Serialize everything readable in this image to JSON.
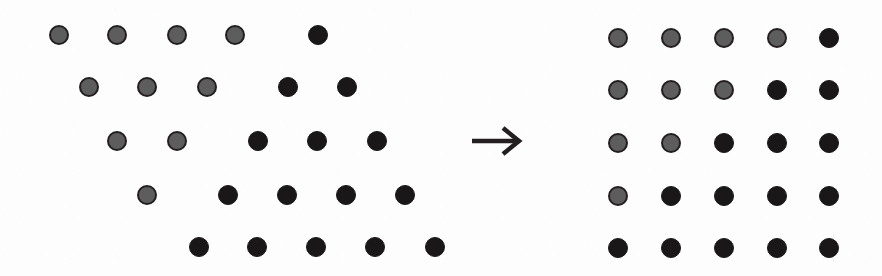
{
  "figure": {
    "background_color": "#fdfdfd",
    "dot_colors": {
      "gray_fill": "#5d5d5d",
      "gray_outline": "#231f20",
      "black_fill": "#1a1718"
    },
    "dot_diameter": 20,
    "arrow": {
      "icon": "right-arrow-icon",
      "label": "→",
      "color": "#231f20",
      "x": 473,
      "y": 141,
      "length": 48
    }
  },
  "chart_data": {
    "type": "scatter",
    "title": "",
    "subtitle": "",
    "xlabel": "",
    "ylabel": "",
    "grid": false,
    "legend": [],
    "annotations": [
      {
        "name": "transform-arrow",
        "text": "→",
        "x": 497,
        "y": 141
      }
    ],
    "panels": [
      {
        "name": "source-staggered-grid",
        "label": "staggered triangular arrangement",
        "rows": 5,
        "cols": 5,
        "row_y": [
          35,
          87,
          141,
          195,
          247
        ],
        "row_x_start": [
          59,
          89,
          117,
          147,
          199
        ],
        "col_spacing": 59,
        "gray_counts_per_row": [
          4,
          3,
          2,
          1,
          0
        ],
        "black_counts_per_row": [
          1,
          2,
          3,
          4,
          5
        ],
        "points": [
          {
            "row": 1,
            "col": 1,
            "x": 59,
            "y": 35,
            "state": "gray"
          },
          {
            "row": 1,
            "col": 2,
            "x": 117,
            "y": 35,
            "state": "gray"
          },
          {
            "row": 1,
            "col": 3,
            "x": 177,
            "y": 35,
            "state": "gray"
          },
          {
            "row": 1,
            "col": 4,
            "x": 235,
            "y": 35,
            "state": "gray"
          },
          {
            "row": 1,
            "col": 5,
            "x": 318,
            "y": 35,
            "state": "black"
          },
          {
            "row": 2,
            "col": 1,
            "x": 89,
            "y": 87,
            "state": "gray"
          },
          {
            "row": 2,
            "col": 2,
            "x": 147,
            "y": 87,
            "state": "gray"
          },
          {
            "row": 2,
            "col": 3,
            "x": 207,
            "y": 87,
            "state": "gray"
          },
          {
            "row": 2,
            "col": 4,
            "x": 288,
            "y": 87,
            "state": "black"
          },
          {
            "row": 2,
            "col": 5,
            "x": 347,
            "y": 87,
            "state": "black"
          },
          {
            "row": 3,
            "col": 1,
            "x": 117,
            "y": 141,
            "state": "gray"
          },
          {
            "row": 3,
            "col": 2,
            "x": 177,
            "y": 141,
            "state": "gray"
          },
          {
            "row": 3,
            "col": 3,
            "x": 258,
            "y": 141,
            "state": "black"
          },
          {
            "row": 3,
            "col": 4,
            "x": 317,
            "y": 141,
            "state": "black"
          },
          {
            "row": 3,
            "col": 5,
            "x": 377,
            "y": 141,
            "state": "black"
          },
          {
            "row": 4,
            "col": 1,
            "x": 147,
            "y": 195,
            "state": "gray"
          },
          {
            "row": 4,
            "col": 2,
            "x": 228,
            "y": 195,
            "state": "black"
          },
          {
            "row": 4,
            "col": 3,
            "x": 287,
            "y": 195,
            "state": "black"
          },
          {
            "row": 4,
            "col": 4,
            "x": 346,
            "y": 195,
            "state": "black"
          },
          {
            "row": 4,
            "col": 5,
            "x": 405,
            "y": 195,
            "state": "black"
          },
          {
            "row": 5,
            "col": 1,
            "x": 199,
            "y": 247,
            "state": "black"
          },
          {
            "row": 5,
            "col": 2,
            "x": 257,
            "y": 247,
            "state": "black"
          },
          {
            "row": 5,
            "col": 3,
            "x": 316,
            "y": 247,
            "state": "black"
          },
          {
            "row": 5,
            "col": 4,
            "x": 375,
            "y": 247,
            "state": "black"
          },
          {
            "row": 5,
            "col": 5,
            "x": 435,
            "y": 247,
            "state": "black"
          }
        ]
      },
      {
        "name": "target-regular-grid",
        "label": "regular square lattice",
        "rows": 5,
        "cols": 5,
        "row_y": [
          38,
          90,
          143,
          196,
          248
        ],
        "col_x": [
          618,
          671,
          724,
          777,
          829
        ],
        "gray_counts_per_row": [
          4,
          3,
          2,
          1,
          0
        ],
        "black_counts_per_row": [
          1,
          2,
          3,
          4,
          5
        ],
        "points": [
          {
            "row": 1,
            "col": 1,
            "x": 618,
            "y": 38,
            "state": "gray"
          },
          {
            "row": 1,
            "col": 2,
            "x": 671,
            "y": 38,
            "state": "gray"
          },
          {
            "row": 1,
            "col": 3,
            "x": 724,
            "y": 38,
            "state": "gray"
          },
          {
            "row": 1,
            "col": 4,
            "x": 777,
            "y": 38,
            "state": "gray"
          },
          {
            "row": 1,
            "col": 5,
            "x": 829,
            "y": 38,
            "state": "black"
          },
          {
            "row": 2,
            "col": 1,
            "x": 618,
            "y": 90,
            "state": "gray"
          },
          {
            "row": 2,
            "col": 2,
            "x": 671,
            "y": 90,
            "state": "gray"
          },
          {
            "row": 2,
            "col": 3,
            "x": 724,
            "y": 90,
            "state": "gray"
          },
          {
            "row": 2,
            "col": 4,
            "x": 777,
            "y": 90,
            "state": "black"
          },
          {
            "row": 2,
            "col": 5,
            "x": 829,
            "y": 90,
            "state": "black"
          },
          {
            "row": 3,
            "col": 1,
            "x": 618,
            "y": 143,
            "state": "gray"
          },
          {
            "row": 3,
            "col": 2,
            "x": 671,
            "y": 143,
            "state": "gray"
          },
          {
            "row": 3,
            "col": 3,
            "x": 724,
            "y": 143,
            "state": "black"
          },
          {
            "row": 3,
            "col": 4,
            "x": 777,
            "y": 143,
            "state": "black"
          },
          {
            "row": 3,
            "col": 5,
            "x": 829,
            "y": 143,
            "state": "black"
          },
          {
            "row": 4,
            "col": 1,
            "x": 618,
            "y": 196,
            "state": "gray"
          },
          {
            "row": 4,
            "col": 2,
            "x": 671,
            "y": 196,
            "state": "black"
          },
          {
            "row": 4,
            "col": 3,
            "x": 724,
            "y": 196,
            "state": "black"
          },
          {
            "row": 4,
            "col": 4,
            "x": 777,
            "y": 196,
            "state": "black"
          },
          {
            "row": 4,
            "col": 5,
            "x": 829,
            "y": 196,
            "state": "black"
          },
          {
            "row": 5,
            "col": 1,
            "x": 618,
            "y": 248,
            "state": "black"
          },
          {
            "row": 5,
            "col": 2,
            "x": 671,
            "y": 248,
            "state": "black"
          },
          {
            "row": 5,
            "col": 3,
            "x": 724,
            "y": 248,
            "state": "black"
          },
          {
            "row": 5,
            "col": 4,
            "x": 777,
            "y": 248,
            "state": "black"
          },
          {
            "row": 5,
            "col": 5,
            "x": 829,
            "y": 248,
            "state": "black"
          }
        ]
      }
    ]
  }
}
